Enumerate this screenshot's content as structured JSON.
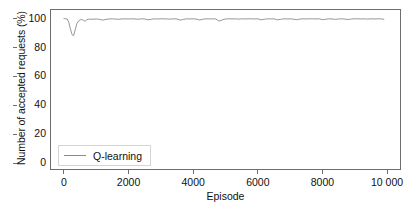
{
  "chart_data": {
    "type": "line",
    "title": "",
    "xlabel": "Episode",
    "ylabel": "Number of accepted requests (%)",
    "xlim": [
      -400,
      10400
    ],
    "ylim": [
      -4,
      106
    ],
    "xticks": [
      0,
      2000,
      4000,
      6000,
      8000,
      10000
    ],
    "xticklabels": [
      "0",
      "2000",
      "4000",
      "6000",
      "8000",
      "10 000"
    ],
    "yticks": [
      0,
      20,
      40,
      60,
      80,
      100
    ],
    "yticklabels": [
      "0",
      "20",
      "40",
      "60",
      "80",
      "100"
    ],
    "grid": false,
    "legend_position": "lower left",
    "line_color": "#8a8a8a",
    "frame_color": "#6e6e6e",
    "series": [
      {
        "name": "Q-learning",
        "x": [
          0,
          50,
          100,
          150,
          200,
          250,
          300,
          350,
          400,
          450,
          500,
          550,
          600,
          650,
          700,
          750,
          800,
          900,
          1000,
          1100,
          1200,
          1300,
          1400,
          1500,
          1600,
          1700,
          1800,
          1900,
          2000,
          2100,
          2200,
          2300,
          2400,
          2500,
          2600,
          2700,
          2800,
          2900,
          3000,
          3100,
          3200,
          3300,
          3400,
          3500,
          3600,
          3700,
          3800,
          3900,
          4000,
          4100,
          4200,
          4300,
          4400,
          4500,
          4600,
          4700,
          4800,
          4900,
          5000,
          5100,
          5200,
          5300,
          5400,
          5500,
          5600,
          5700,
          5800,
          5900,
          6000,
          6100,
          6200,
          6300,
          6400,
          6500,
          6600,
          6700,
          6800,
          6900,
          7000,
          7100,
          7200,
          7300,
          7400,
          7500,
          7600,
          7700,
          7800,
          7900,
          8000,
          8100,
          8200,
          8300,
          8400,
          8500,
          8600,
          8700,
          8800,
          8900,
          9000,
          9100,
          9200,
          9300,
          9400,
          9500,
          9600,
          9700,
          9800,
          9900
        ],
        "y": [
          100,
          100,
          99.8,
          97.5,
          93.0,
          89.0,
          88.2,
          92.5,
          96.5,
          98.4,
          99.2,
          99.4,
          99.0,
          98.2,
          99.1,
          99.6,
          99.7,
          99.6,
          99.8,
          99.5,
          99.0,
          99.5,
          99.8,
          99.9,
          99.7,
          99.6,
          99.8,
          99.9,
          99.8,
          99.9,
          99.8,
          99.6,
          99.9,
          99.8,
          99.2,
          99.6,
          99.9,
          99.8,
          99.9,
          99.9,
          99.8,
          99.7,
          99.9,
          99.8,
          99.0,
          99.5,
          99.9,
          99.8,
          99.9,
          99.7,
          99.1,
          99.6,
          99.9,
          99.8,
          99.9,
          99.8,
          98.3,
          99.2,
          99.8,
          99.9,
          99.8,
          99.9,
          99.7,
          99.9,
          99.8,
          99.9,
          99.9,
          99.8,
          99.9,
          99.2,
          99.6,
          99.9,
          99.8,
          99.9,
          99.2,
          99.5,
          99.9,
          99.8,
          99.9,
          99.7,
          99.3,
          99.7,
          99.9,
          99.8,
          99.9,
          99.9,
          99.8,
          99.9,
          99.3,
          99.6,
          99.9,
          99.8,
          99.5,
          99.8,
          99.9,
          99.7,
          99.4,
          99.8,
          99.9,
          99.9,
          99.8,
          99.9,
          99.7,
          99.9,
          99.8,
          99.9,
          99.9,
          99.6
        ]
      }
    ]
  },
  "legend": {
    "entries": [
      {
        "label": "Q-learning"
      }
    ]
  }
}
